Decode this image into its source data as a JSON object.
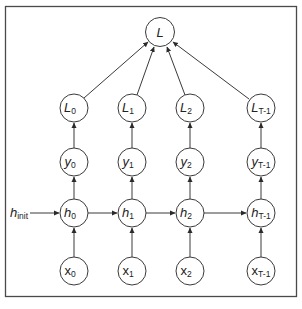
{
  "diagram": {
    "loss_node": {
      "label": "L",
      "sub": ""
    },
    "init_label": {
      "label": "h",
      "sub": "init"
    },
    "columns": [
      {
        "loss": {
          "label": "L",
          "sub": "0"
        },
        "output": {
          "label": "y",
          "sub": "0"
        },
        "hidden": {
          "label": "h",
          "sub": "0"
        },
        "input": {
          "label": "x",
          "sub": "0"
        }
      },
      {
        "loss": {
          "label": "L",
          "sub": "1"
        },
        "output": {
          "label": "y",
          "sub": "1"
        },
        "hidden": {
          "label": "h",
          "sub": "1"
        },
        "input": {
          "label": "x",
          "sub": "1"
        }
      },
      {
        "loss": {
          "label": "L",
          "sub": "2"
        },
        "output": {
          "label": "y",
          "sub": "2"
        },
        "hidden": {
          "label": "h",
          "sub": "2"
        },
        "input": {
          "label": "x",
          "sub": "2"
        }
      },
      {
        "loss": {
          "label": "L",
          "sub": "T-1"
        },
        "output": {
          "label": "y",
          "sub": "T-1"
        },
        "hidden": {
          "label": "h",
          "sub": "T-1"
        },
        "input": {
          "label": "x",
          "sub": "T-1"
        }
      }
    ],
    "colors": {
      "stroke": "#3a3a3a",
      "background": "#ffffff",
      "frame": "#4a4a4a"
    }
  }
}
